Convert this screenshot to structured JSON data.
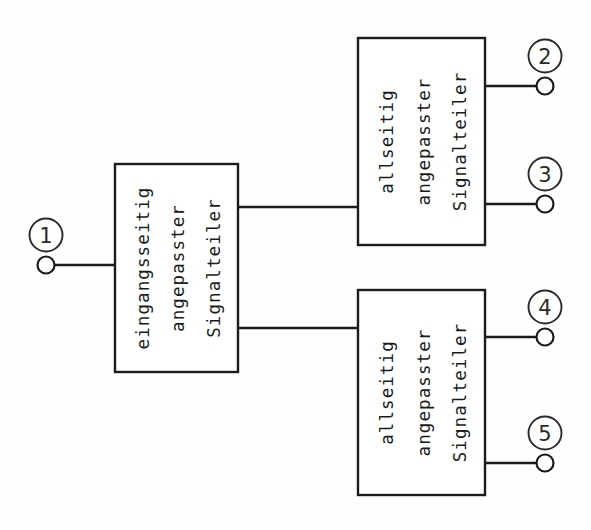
{
  "diagram": {
    "background_color": "#fefefe",
    "line_color": "#1b1b1b",
    "blocks": [
      {
        "id": "input-divider",
        "label_lines": [
          "eingangsseitig",
          "angepasster",
          "Signalteiler"
        ],
        "x": 115,
        "y": 164,
        "w": 123,
        "h": 208
      },
      {
        "id": "upper-divider",
        "label_lines": [
          "allseitig",
          "angepasster",
          "Signalteiler"
        ],
        "x": 358,
        "y": 38,
        "w": 127,
        "h": 207
      },
      {
        "id": "lower-divider",
        "label_lines": [
          "allseitig",
          "angepasster",
          "Signalteiler"
        ],
        "x": 358,
        "y": 290,
        "w": 127,
        "h": 205
      }
    ],
    "ports": [
      {
        "number": "1",
        "side": "left",
        "terminal_x": 46,
        "terminal_y": 265,
        "wire_to_x": 115,
        "label_x": 46,
        "label_y": 235
      },
      {
        "number": "2",
        "side": "right",
        "terminal_x": 545,
        "terminal_y": 86,
        "wire_to_x": 485,
        "label_x": 545,
        "label_y": 56
      },
      {
        "number": "3",
        "side": "right",
        "terminal_x": 545,
        "terminal_y": 204,
        "wire_to_x": 485,
        "label_x": 545,
        "label_y": 174
      },
      {
        "number": "4",
        "side": "right",
        "terminal_x": 545,
        "terminal_y": 337,
        "wire_to_x": 485,
        "label_x": 545,
        "label_y": 307
      },
      {
        "number": "5",
        "side": "right",
        "terminal_x": 545,
        "terminal_y": 463,
        "wire_to_x": 485,
        "label_x": 545,
        "label_y": 433
      }
    ],
    "links": [
      {
        "id": "link-to-upper",
        "x1": 238,
        "y1": 207,
        "x2": 358,
        "y2": 207
      },
      {
        "id": "link-to-lower",
        "x1": 238,
        "y1": 328,
        "x2": 358,
        "y2": 328
      }
    ]
  }
}
